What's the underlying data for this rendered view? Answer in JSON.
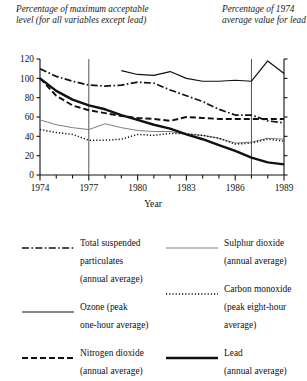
{
  "captions": {
    "left": "Percentage of maximum acceptable level (for all variables except lead)",
    "right": "Percentage of 1974 average value for lead"
  },
  "chart_data": {
    "type": "line",
    "title": "",
    "xlabel": "Year",
    "ylabel": "",
    "xlim": [
      1974,
      1989
    ],
    "ylim": [
      0,
      120
    ],
    "yticks": [
      0,
      20,
      40,
      60,
      80,
      100,
      120
    ],
    "xticks": [
      1974,
      1975,
      1976,
      1977,
      1978,
      1979,
      1980,
      1981,
      1982,
      1983,
      1984,
      1985,
      1986,
      1987,
      1988,
      1989
    ],
    "xtick_labels_shown": [
      1974,
      1977,
      1980,
      1983,
      1986,
      1989
    ],
    "grid": false,
    "legend_position": "below",
    "vertical_reference_lines": [
      1977,
      1987
    ],
    "series": [
      {
        "name": "Total suspended particulates (annual average)",
        "style": "dash-dot",
        "x": [
          1974,
          1975,
          1976,
          1977,
          1978,
          1979,
          1980,
          1981,
          1982,
          1983,
          1984,
          1985,
          1986,
          1987,
          1988,
          1989
        ],
        "values": [
          110,
          102,
          97,
          93,
          92,
          93,
          96,
          95,
          88,
          82,
          76,
          68,
          62,
          62,
          56,
          54
        ]
      },
      {
        "name": "Ozone (peak one-hour average)",
        "style": "thin-solid-dark",
        "x": [
          1979,
          1980,
          1981,
          1982,
          1983,
          1984,
          1985,
          1986,
          1987,
          1988,
          1989
        ],
        "values": [
          108,
          104,
          103,
          107,
          100,
          97,
          97,
          98,
          97,
          118,
          105
        ],
        "note": "upper-right series rising after 1987"
      },
      {
        "name": "Nitrogen dioxide (annual average)",
        "style": "dashed",
        "x": [
          1974,
          1975,
          1976,
          1977,
          1978,
          1979,
          1980,
          1981,
          1982,
          1983,
          1984,
          1985,
          1986,
          1987,
          1988,
          1989
        ],
        "values": [
          100,
          82,
          72,
          67,
          64,
          61,
          59,
          58,
          56,
          60,
          59,
          58,
          58,
          58,
          58,
          58
        ]
      },
      {
        "name": "Sulphur dioxide (annual average)",
        "style": "thin-solid-light",
        "x": [
          1974,
          1975,
          1976,
          1977,
          1978,
          1979,
          1980,
          1981,
          1982,
          1983,
          1984,
          1985,
          1986,
          1987,
          1988,
          1989
        ],
        "values": [
          57,
          52,
          49,
          47,
          53,
          49,
          46,
          45,
          45,
          42,
          41,
          38,
          33,
          34,
          38,
          37
        ]
      },
      {
        "name": "Carbon monoxide (peak eight-hour average)",
        "style": "dotted",
        "x": [
          1974,
          1975,
          1976,
          1977,
          1978,
          1979,
          1980,
          1981,
          1982,
          1983,
          1984,
          1985,
          1986,
          1987,
          1988,
          1989
        ],
        "values": [
          47,
          44,
          42,
          36,
          36,
          37,
          42,
          41,
          43,
          43,
          41,
          38,
          32,
          33,
          37,
          35
        ]
      },
      {
        "name": "Lead (annual average)",
        "style": "thick-solid",
        "x": [
          1974,
          1975,
          1976,
          1977,
          1978,
          1979,
          1980,
          1981,
          1982,
          1983,
          1984,
          1985,
          1986,
          1987,
          1988,
          1989
        ],
        "values": [
          100,
          87,
          78,
          72,
          68,
          62,
          57,
          52,
          48,
          42,
          37,
          31,
          25,
          18,
          13,
          11
        ]
      }
    ]
  },
  "legend": {
    "left_items": [
      {
        "label": "Total suspended\nparticulates\n(annual average)",
        "style": "dash-dot"
      },
      {
        "label": "Ozone (peak\none-hour average)",
        "style": "thin-solid-dark"
      },
      {
        "label": "Nitrogen dioxide\n(annual average)",
        "style": "dashed"
      }
    ],
    "right_items": [
      {
        "label": "Sulphur dioxide\n(annual average)",
        "style": "thin-solid-light"
      },
      {
        "label": "Carbon monoxide\n(peak eight-hour\naverage)",
        "style": "dotted"
      },
      {
        "label": "Lead\n(annual average)",
        "style": "thick-solid"
      }
    ]
  },
  "colors": {
    "ink": "#111111",
    "light_ink": "#6f6f6f",
    "background": "#ffffff"
  }
}
